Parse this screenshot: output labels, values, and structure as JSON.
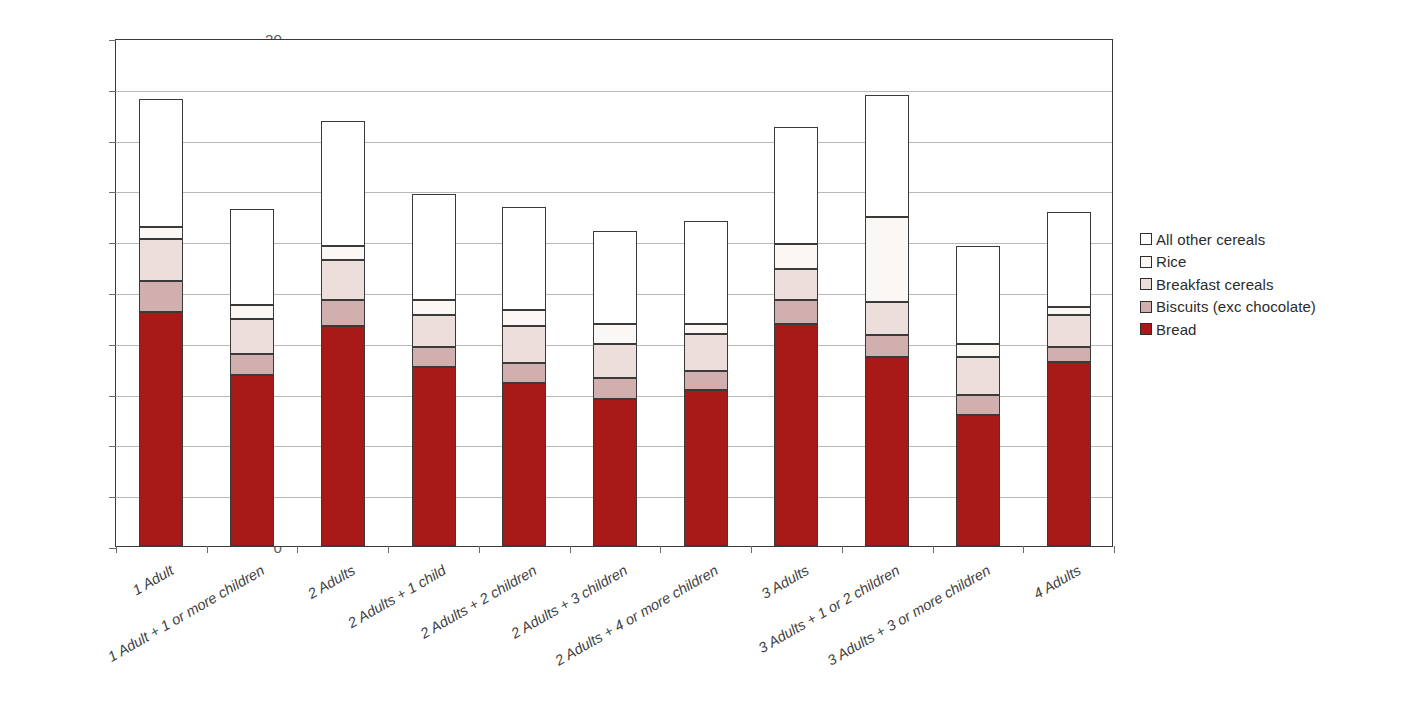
{
  "chart_data": {
    "type": "bar",
    "stacked": true,
    "title": "",
    "xlabel": "",
    "ylabel": "",
    "ylim": [
      0,
      20
    ],
    "ytick_step": 2,
    "yticks": [
      "0",
      "2",
      "4",
      "6",
      "8",
      "10",
      "12",
      "14",
      "16",
      "18",
      "20"
    ],
    "grid": "horizontal",
    "legend_position": "right",
    "categories": [
      "1 Adult",
      "1 Adult + 1 or more children",
      "2 Adults",
      "2 Adults + 1 child",
      "2 Adults + 2 children",
      "2 Adults + 3 children",
      "2 Adults + 4 or more children",
      "3 Adults",
      "3 Adults + 1 or 2 children",
      "3 Adults + 3 or more children",
      "4 Adults"
    ],
    "series": [
      {
        "name": "Bread",
        "color": "#a81a18",
        "values": [
          9.2,
          6.75,
          8.65,
          7.05,
          6.4,
          5.8,
          6.15,
          8.75,
          7.45,
          5.15,
          7.25
        ]
      },
      {
        "name": "Biscuits (exc chocolate)",
        "color": "#d2afaf",
        "values": [
          1.25,
          0.8,
          1.05,
          0.8,
          0.8,
          0.8,
          0.75,
          0.95,
          0.85,
          0.8,
          0.6
        ]
      },
      {
        "name": "Breakfast cereals",
        "color": "#ecdfdb",
        "values": [
          1.65,
          1.4,
          1.55,
          1.25,
          1.45,
          1.35,
          1.45,
          1.2,
          1.3,
          1.5,
          1.25
        ]
      },
      {
        "name": "Rice",
        "color": "#fbf7f5",
        "values": [
          0.45,
          0.55,
          0.55,
          0.6,
          0.65,
          0.8,
          0.4,
          1.0,
          3.35,
          0.5,
          0.3
        ]
      },
      {
        "name": "All other cereals",
        "color": "#ffffff",
        "values": [
          5.05,
          3.75,
          4.95,
          4.15,
          4.05,
          3.65,
          4.05,
          4.6,
          4.8,
          3.85,
          3.75
        ]
      }
    ],
    "totals": [
      17.6,
      13.25,
      16.75,
      13.85,
      13.35,
      12.4,
      12.8,
      16.5,
      17.75,
      11.8,
      13.15
    ]
  },
  "legend": {
    "items": [
      {
        "label": "All other cereals",
        "color": "#ffffff"
      },
      {
        "label": "Rice",
        "color": "#fbf7f5"
      },
      {
        "label": "Breakfast cereals",
        "color": "#ecdfdb"
      },
      {
        "label": "Biscuits (exc chocolate)",
        "color": "#d2afaf"
      },
      {
        "label": "Bread",
        "color": "#a81a18"
      }
    ]
  }
}
